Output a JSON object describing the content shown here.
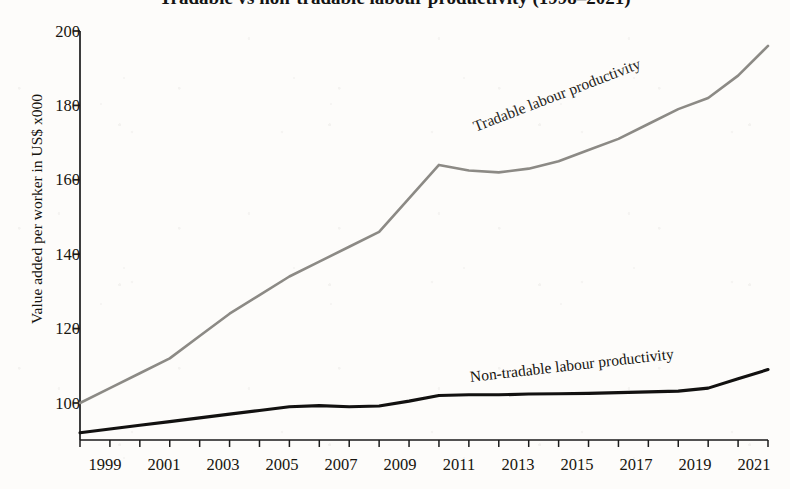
{
  "chart_data": {
    "type": "line",
    "title": "Tradable vs non-tradable labour productivity (1998–2021)",
    "xlabel": "",
    "ylabel": "Value added per worker in US$ x000",
    "xlim": [
      1998,
      2021
    ],
    "ylim": [
      88,
      200
    ],
    "grid": false,
    "legend_position": "inline-along-series",
    "x_tick_labels": [
      "1999",
      "2001",
      "2003",
      "2005",
      "2007",
      "2009",
      "2011",
      "2013",
      "2015",
      "2017",
      "2019",
      "2021"
    ],
    "x_ticks": [
      1999,
      2001,
      2003,
      2005,
      2007,
      2009,
      2011,
      2013,
      2015,
      2017,
      2019,
      2021
    ],
    "x_minor_ticks": [
      1998,
      2000,
      2002,
      2004,
      2006,
      2008,
      2010,
      2012,
      2014,
      2016,
      2018,
      2020
    ],
    "y_tick_labels": [
      "100",
      "120",
      "140",
      "160",
      "180",
      "200"
    ],
    "y_ticks": [
      100,
      120,
      140,
      160,
      180,
      200
    ],
    "x": [
      1998,
      1999,
      2000,
      2001,
      2002,
      2003,
      2004,
      2005,
      2006,
      2007,
      2008,
      2009,
      2010,
      2011,
      2012,
      2013,
      2014,
      2015,
      2016,
      2017,
      2018,
      2019,
      2020,
      2021
    ],
    "series": [
      {
        "name": "Tradable labour productivity",
        "color": "#8c8a85",
        "label_text": "Tradable labour productivity",
        "values": [
          100,
          104,
          108,
          112,
          118,
          124,
          129,
          134,
          138,
          142,
          146,
          155,
          164,
          162.5,
          162,
          163,
          165,
          168,
          171,
          175,
          179,
          182,
          188,
          196
        ]
      },
      {
        "name": "Non-tradable labour productivity",
        "color": "#121110",
        "label_text": "Non-tradable labour productivity",
        "values": [
          92,
          93,
          94,
          95,
          96,
          97,
          98,
          99,
          99.3,
          99,
          99.2,
          100.5,
          102,
          102.2,
          102.2,
          102.4,
          102.5,
          102.6,
          102.8,
          103,
          103.2,
          104,
          106.5,
          109
        ]
      }
    ]
  },
  "axes": {
    "y_axis_title": "Value added per worker in US$ x000",
    "y_tick_labels": [
      "200",
      "180",
      "160",
      "140",
      "120",
      "100"
    ],
    "x_tick_labels": [
      "1999",
      "2001",
      "2003",
      "2005",
      "2007",
      "2009",
      "2011",
      "2013",
      "2015",
      "2017",
      "2019",
      "2021"
    ]
  },
  "labels": {
    "tradable": "Tradable labour productivity",
    "nontradable": "Non-tradable labour productivity"
  },
  "header": {
    "title_partial": "Tradable vs non-tradable labour productivity (1998–2021)"
  },
  "colors": {
    "tradable_line": "#8c8a85",
    "nontradable_line": "#121110",
    "axis": "#1a1a1a",
    "background": "#fdfcfa"
  }
}
